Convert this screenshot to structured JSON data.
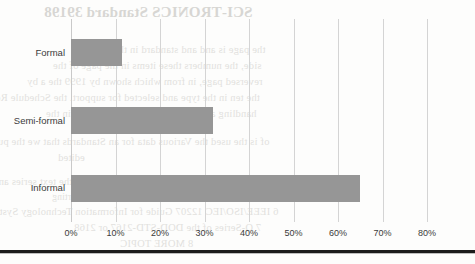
{
  "chart_data": {
    "type": "bar",
    "orientation": "horizontal",
    "title": "",
    "xlabel": "",
    "ylabel": "",
    "categories": [
      "Formal",
      "Semi-formal",
      "Informal"
    ],
    "values": [
      11.5,
      32,
      65
    ],
    "value_suffix": "%",
    "xlim": [
      0,
      80
    ],
    "xticks": [
      0,
      10,
      20,
      30,
      40,
      50,
      60,
      70,
      80
    ],
    "xtick_labels": [
      "0%",
      "10%",
      "20%",
      "30%",
      "40%",
      "50%",
      "60%",
      "70%",
      "80%"
    ],
    "grid": "vertical",
    "legend": "none",
    "bar_color": "#969696",
    "gridline_color": "#d4d4d4",
    "axis_text_color": "#3a3a3a"
  },
  "background_bleed": {
    "note": "faint mirrored show-through text from the reverse side of the scanned page",
    "title": "SCI-TRONICS Standard 39198",
    "lines": [
      "the page is and and standard in the reverse",
      "side, the numbers these items in the page of the",
      "reversed page, in from which shown by 1999 the a by",
      "the ten in the type and selected for support. the Schedule Report",
      "handling and creating information system in the"
    ],
    "lines2": [
      "of is the used the Various data for an Standards that we the purpose",
      "edited"
    ],
    "lines3": [
      "4 IEEE 1471-1996 directory of the for the for the text series and",
      "supporting",
      "6 IEEE/ISO/IEC 12207 Guide for Information Technology Systems Design Life-cycle",
      "7 O-Series of the DOD-STD-2167 or 2168",
      "8 MORE TOPIC"
    ]
  },
  "bottom_rule": {
    "color": "#1c1c1c"
  }
}
